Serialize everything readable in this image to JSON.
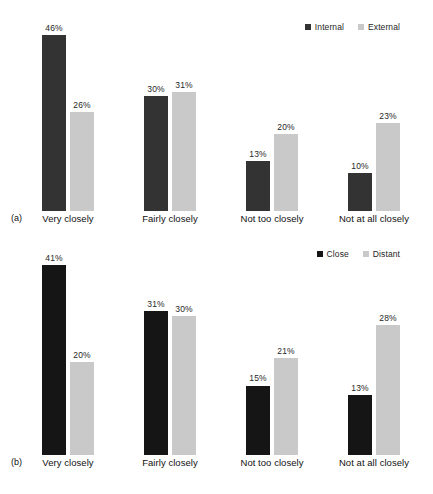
{
  "chart_data": [
    {
      "type": "bar",
      "panel": "(a)",
      "title": "",
      "xlabel": "",
      "ylabel": "",
      "ylim": [
        0,
        50
      ],
      "grid": false,
      "legend_position": "top-right",
      "categories": [
        "Very closely",
        "Fairly closely",
        "Not too closely",
        "Not at all closely"
      ],
      "series": [
        {
          "name": "Internal",
          "color": "#333333",
          "values": [
            46,
            30,
            13,
            10
          ],
          "labels": [
            "46%",
            "30%",
            "13%",
            "10%"
          ]
        },
        {
          "name": "External",
          "color": "#c9c9c9",
          "values": [
            26,
            31,
            20,
            23
          ],
          "labels": [
            "26%",
            "31%",
            "20%",
            "23%"
          ]
        }
      ]
    },
    {
      "type": "bar",
      "panel": "(b)",
      "title": "",
      "xlabel": "",
      "ylabel": "",
      "ylim": [
        0,
        45
      ],
      "grid": false,
      "legend_position": "top-right",
      "categories": [
        "Very closely",
        "Fairly closely",
        "Not too closely",
        "Not at all closely"
      ],
      "series": [
        {
          "name": "Close",
          "color": "#151515",
          "values": [
            41,
            31,
            15,
            13
          ],
          "labels": [
            "41%",
            "31%",
            "15%",
            "13%"
          ]
        },
        {
          "name": "Distant",
          "color": "#c9c9c9",
          "values": [
            20,
            30,
            21,
            28
          ],
          "labels": [
            "20%",
            "30%",
            "21%",
            "28%"
          ]
        }
      ]
    }
  ],
  "panel_a": {
    "tag": "(a)",
    "legend": [
      {
        "label": "Internal",
        "color": "#333333"
      },
      {
        "label": "External",
        "color": "#c9c9c9"
      }
    ],
    "categories": [
      {
        "label": "Very closely"
      },
      {
        "label": "Fairly closely"
      },
      {
        "label": "Not too closely"
      },
      {
        "label": "Not at all closely"
      }
    ],
    "bars": [
      {
        "value": "46%",
        "pct": 46,
        "series": "Internal"
      },
      {
        "value": "26%",
        "pct": 26,
        "series": "External"
      },
      {
        "value": "30%",
        "pct": 30,
        "series": "Internal"
      },
      {
        "value": "31%",
        "pct": 31,
        "series": "External"
      },
      {
        "value": "13%",
        "pct": 13,
        "series": "Internal"
      },
      {
        "value": "20%",
        "pct": 20,
        "series": "External"
      },
      {
        "value": "10%",
        "pct": 10,
        "series": "Internal"
      },
      {
        "value": "23%",
        "pct": 23,
        "series": "External"
      }
    ]
  },
  "panel_b": {
    "tag": "(b)",
    "legend": [
      {
        "label": "Close",
        "color": "#151515"
      },
      {
        "label": "Distant",
        "color": "#c9c9c9"
      }
    ],
    "categories": [
      {
        "label": "Very closely"
      },
      {
        "label": "Fairly closely"
      },
      {
        "label": "Not too closely"
      },
      {
        "label": "Not at all closely"
      }
    ],
    "bars": [
      {
        "value": "41%",
        "pct": 41,
        "series": "Close"
      },
      {
        "value": "20%",
        "pct": 20,
        "series": "Distant"
      },
      {
        "value": "31%",
        "pct": 31,
        "series": "Close"
      },
      {
        "value": "30%",
        "pct": 30,
        "series": "Distant"
      },
      {
        "value": "15%",
        "pct": 15,
        "series": "Close"
      },
      {
        "value": "21%",
        "pct": 21,
        "series": "Distant"
      },
      {
        "value": "13%",
        "pct": 13,
        "series": "Close"
      },
      {
        "value": "28%",
        "pct": 28,
        "series": "Distant"
      }
    ]
  }
}
